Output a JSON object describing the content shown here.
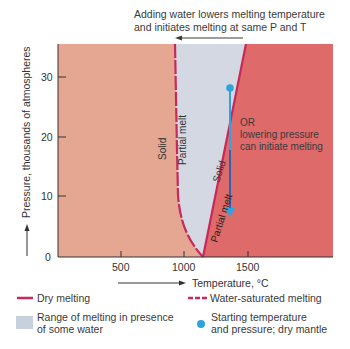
{
  "header": {
    "annotation_line1": "Adding water lowers melting temperature",
    "annotation_line2": "and initiates melting at same P and T"
  },
  "axes": {
    "y_label": "Pressure, thousands of atmospheres",
    "x_label": "Temperature, °C",
    "y_ticks": [
      "0",
      "10",
      "20",
      "30"
    ],
    "x_ticks": [
      "500",
      "1000",
      "1500"
    ]
  },
  "regions": {
    "solid_left": "Solid",
    "partial_melt_left": "Partial melt",
    "solid_right": "Solid",
    "partial_melt_right": "Partial melt"
  },
  "annotations": {
    "pressure_line1": "OR",
    "pressure_line2": "lowering pressure",
    "pressure_line3": "can initiate melting"
  },
  "legend": {
    "dry_melting": "Dry melting",
    "water_saturated": "Water-saturated melting",
    "range_line1": "Range of melting in presence",
    "range_line2": "of some water",
    "start_line1": "Starting temperature",
    "start_line2": "and pressure; dry mantle"
  },
  "colors": {
    "solid_region": "#e6a792",
    "melt_region": "#de6a6a",
    "water_range": "#d3d8e2",
    "curve": "#c8285a",
    "start_point": "#2ea3dc",
    "arrow": "#3a3a3a"
  }
}
